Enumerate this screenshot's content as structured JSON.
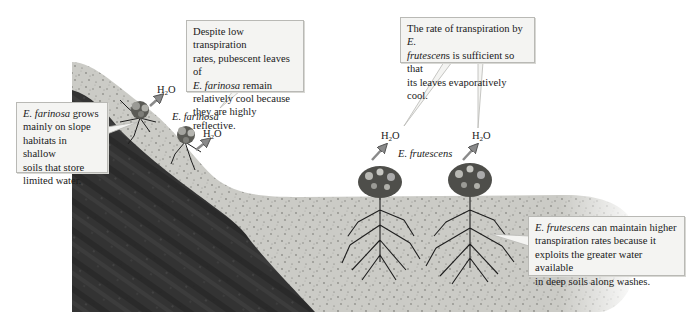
{
  "diagram": {
    "type": "ecological cross-section"
  },
  "callouts": {
    "farinosa_leaves": {
      "lines": [
        "Despite low transpiration",
        "rates, pubescent leaves of",
        "remain",
        "relatively cool because",
        "they are highly reflective."
      ],
      "species": "E. farinosa"
    },
    "farinosa_habitat": {
      "species": "E. farinosa",
      "lines": [
        "grows",
        "mainly on slope",
        "habitats in shallow",
        "soils that store",
        "limited water."
      ]
    },
    "frutescens_rate": {
      "lines": [
        "The rate of transpiration by",
        "E.",
        "frutescen",
        "s is sufficient so that",
        "its leaves evaporatively cool."
      ]
    },
    "frutescens_habitat": {
      "species": "E. frutescens",
      "lines": [
        "can maintain higher",
        "transpiration rates because it",
        "exploits the greater water available",
        "in deep soils along washes."
      ]
    }
  },
  "labels": {
    "farinosa": "E. farinosa",
    "frutescens": "E. frutescens"
  },
  "water": {
    "h": "H",
    "sub": "2",
    "o": "O",
    "markers": [
      {
        "id": "farinosa-upper",
        "x": 157,
        "y": 86
      },
      {
        "id": "farinosa-lower",
        "x": 203,
        "y": 130
      },
      {
        "id": "frutescens-left",
        "x": 381,
        "y": 132
      },
      {
        "id": "frutescens-right",
        "x": 472,
        "y": 132
      }
    ]
  },
  "colors": {
    "rock_dark": "#2b2b2b",
    "rock_mid": "#4a4a4a",
    "soil_light": "#c9c9c4",
    "soil_speck": "#8d8d88",
    "callout_bg": "#f4f4f2",
    "callout_border": "#b9b9b5",
    "arrow_fill": "#8a8a8a",
    "plant_dark": "#1e1e1e"
  }
}
